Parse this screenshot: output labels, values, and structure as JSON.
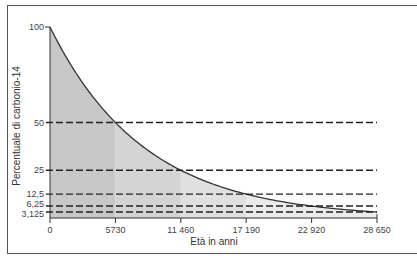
{
  "chart_data": {
    "type": "area",
    "title": "",
    "xlabel": "Età in anni",
    "ylabel": "Percentuale di carbonio-14",
    "x": [
      0,
      5730,
      11460,
      17190,
      22920,
      28650
    ],
    "x_tick_labels": [
      "0",
      "5730",
      "11 460",
      "17 190",
      "22 920",
      "28 650"
    ],
    "y_tick_labels": [
      "100",
      "50",
      "25",
      "12,5",
      "6,25",
      "3,125"
    ],
    "series": [
      {
        "name": "Decadimento del carbonio-14",
        "values": [
          100,
          50,
          25,
          12.5,
          6.25,
          3.125
        ]
      }
    ],
    "half_life_years": 5730,
    "xlim": [
      0,
      28650
    ],
    "ylim": [
      0,
      100
    ],
    "grid": false,
    "legend": "none",
    "annotations": [
      "dashed horizontal lines at 50, 25, 12,5, 6,25, 3,125 marking each half-life",
      "shaded bands under the curve alternating per half-life interval"
    ],
    "colors": {
      "curve": "#333333",
      "dash": "#222222",
      "band_dark": "#c8c8c8",
      "band_mid": "#d4d4d4",
      "band_light": "#e0e0e0",
      "band_lightest": "#ebebeb"
    }
  }
}
